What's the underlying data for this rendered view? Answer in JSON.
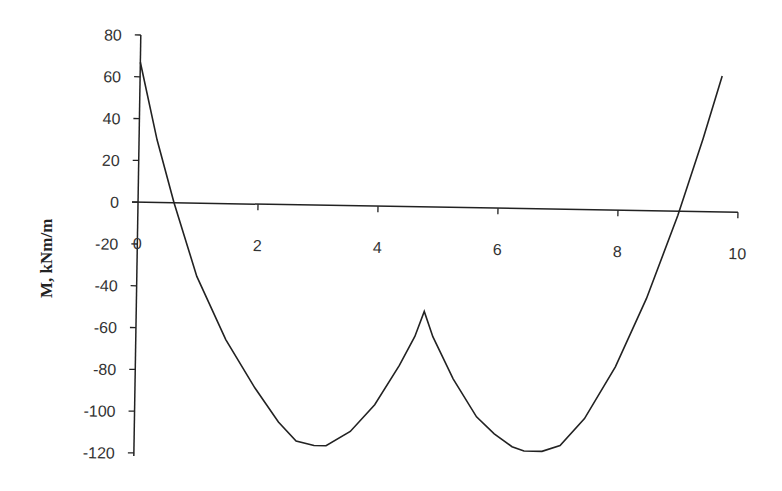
{
  "chart_data": {
    "type": "line",
    "title": "",
    "xlabel": "",
    "ylabel": "M, kNm/m",
    "xlim": [
      0,
      10
    ],
    "ylim": [
      -120,
      80
    ],
    "x_ticks": [
      "0",
      "2",
      "4",
      "6",
      "8",
      "10"
    ],
    "y_ticks": [
      "80",
      "60",
      "40",
      "20",
      "0",
      "-20",
      "-40",
      "-60",
      "-80",
      "-100",
      "-120"
    ],
    "grid": false,
    "legend": null,
    "series": [
      {
        "name": "Bending moment",
        "color": "#222222",
        "x": [
          0,
          0.3,
          0.6,
          1.0,
          1.5,
          2.0,
          2.4,
          2.7,
          3.0,
          3.2,
          3.6,
          4.0,
          4.4,
          4.65,
          4.8,
          4.95,
          5.3,
          5.7,
          6.0,
          6.3,
          6.5,
          6.8,
          7.1,
          7.5,
          8.0,
          8.5,
          9.0,
          9.4,
          9.7
        ],
        "y": [
          67,
          30,
          0,
          -35,
          -65,
          -88,
          -104,
          -113,
          -115,
          -115,
          -108,
          -95,
          -76,
          -62,
          -50,
          -62,
          -82,
          -100,
          -108,
          -114,
          -116,
          -116,
          -113,
          -100,
          -75,
          -42,
          -2,
          35,
          65
        ]
      }
    ]
  }
}
